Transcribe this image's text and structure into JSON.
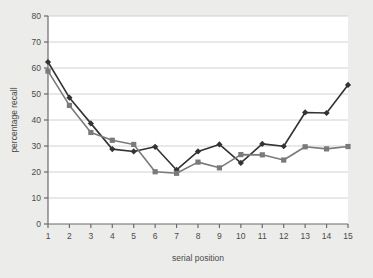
{
  "chart_data": {
    "type": "line",
    "title": "",
    "xlabel": "serial position",
    "ylabel": "percentage recall",
    "x": [
      1,
      2,
      3,
      4,
      5,
      6,
      7,
      8,
      9,
      10,
      11,
      12,
      13,
      14,
      15
    ],
    "xtick_labels": [
      "1",
      "2",
      "3",
      "4",
      "5",
      "6",
      "7",
      "8",
      "9",
      "10",
      "11",
      "12",
      "13",
      "14",
      "15"
    ],
    "ytick_labels": [
      "0",
      "10",
      "20",
      "30",
      "40",
      "50",
      "60",
      "70",
      "80"
    ],
    "yticks": [
      0,
      10,
      20,
      30,
      40,
      50,
      60,
      70,
      80
    ],
    "ylim": [
      0,
      80
    ],
    "xlim": [
      1,
      15
    ],
    "grid": "horizontal",
    "legend": "none",
    "series": [
      {
        "name": "series-diamond",
        "marker": "diamond",
        "color": "#333333",
        "values": [
          62.3,
          48.6,
          38.7,
          28.8,
          27.9,
          29.7,
          20.8,
          27.9,
          30.6,
          23.5,
          30.8,
          29.9,
          42.9,
          42.7,
          53.5
        ]
      },
      {
        "name": "series-square",
        "marker": "square",
        "color": "#7a7a7a",
        "values": [
          58.8,
          45.6,
          35.2,
          32.2,
          30.6,
          20.1,
          19.5,
          23.8,
          21.6,
          26.7,
          26.6,
          24.6,
          29.7,
          28.9,
          29.8
        ]
      }
    ],
    "colors": {
      "background": "#ececeb",
      "plot_background": "#ffffff",
      "grid": "#d2d2d2",
      "axis": "#6b6b6b",
      "text": "#4a4a4a"
    }
  }
}
